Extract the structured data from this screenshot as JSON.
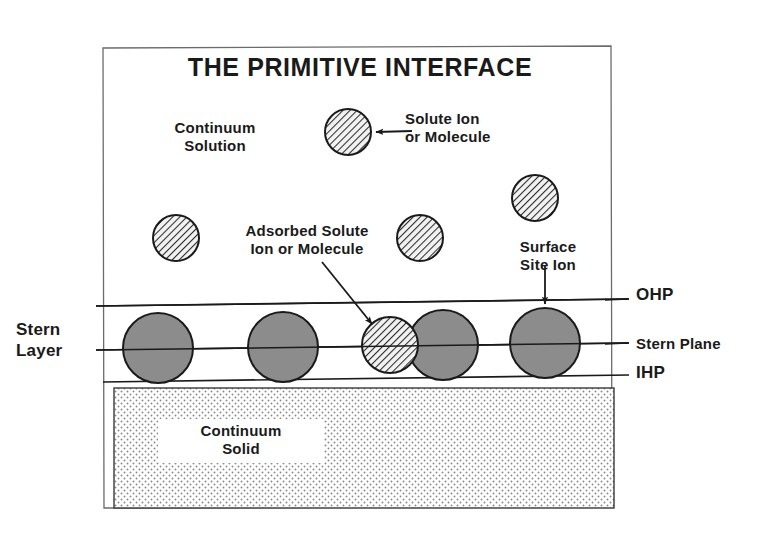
{
  "figure": {
    "title": "THE PRIMITIVE INTERFACE",
    "type": "schematic-diagram",
    "canvas": {
      "width": 762,
      "height": 547,
      "background": "#ffffff"
    },
    "frame": {
      "x": 103,
      "y": 47,
      "width": 509,
      "height": 461,
      "stroke": "#555555"
    }
  },
  "labels": {
    "title": "THE PRIMITIVE INTERFACE",
    "continuum_solution": "Continuum\nSolution",
    "solute_ion": "Solute Ion\nor Molecule",
    "adsorbed_solute": "Adsorbed Solute\nIon or Molecule",
    "surface_site_ion": "Surface\nSite Ion",
    "stern_layer": "Stern\nLayer",
    "ohp": "OHP",
    "stern_plane": "Stern Plane",
    "ihp": "IHP",
    "continuum_solid": "Continuum\nSolid"
  },
  "planes": [
    {
      "name": "OHP",
      "label": "OHP",
      "y_left": 305,
      "y_right": 299,
      "x_start": 96,
      "x_end": 629,
      "stroke": "#1a1a1a",
      "width": 1.6
    },
    {
      "name": "Stern Plane",
      "label": "Stern Plane",
      "y_left": 349,
      "y_right": 342,
      "x_start": 96,
      "x_end": 629,
      "stroke": "#1a1a1a",
      "width": 1.6
    },
    {
      "name": "IHP",
      "label": "IHP",
      "y_left": 381,
      "y_right": 374,
      "x_start": 103,
      "x_end": 629,
      "stroke": "#1a1a1a",
      "width": 1.6
    }
  ],
  "solid_block": {
    "name": "Continuum Solid",
    "x": 114,
    "y": 388,
    "width": 500,
    "height": 120,
    "fill_pattern": "stipple-dots",
    "stroke": "#333333"
  },
  "particles": {
    "solute_ions": [
      {
        "id": "solute-1",
        "cx": 348,
        "cy": 132,
        "r": 23,
        "style": "hatched",
        "region": "continuum-solution"
      },
      {
        "id": "solute-2",
        "cx": 176,
        "cy": 238,
        "r": 23,
        "style": "hatched",
        "region": "continuum-solution"
      },
      {
        "id": "solute-3",
        "cx": 420,
        "cy": 238,
        "r": 23,
        "style": "hatched",
        "region": "continuum-solution"
      },
      {
        "id": "solute-4",
        "cx": 535,
        "cy": 198,
        "r": 23,
        "style": "hatched",
        "region": "continuum-solution"
      }
    ],
    "adsorbed_ions": [
      {
        "id": "adsorbed-1",
        "cx": 390,
        "cy": 345,
        "r": 28,
        "style": "hatched",
        "region": "stern-layer"
      }
    ],
    "surface_site_ions": [
      {
        "id": "site-1",
        "cx": 158,
        "cy": 348,
        "r": 35,
        "style": "gray",
        "region": "stern-layer"
      },
      {
        "id": "site-2",
        "cx": 283,
        "cy": 347,
        "r": 35,
        "style": "gray",
        "region": "stern-layer"
      },
      {
        "id": "site-3",
        "cx": 443,
        "cy": 345,
        "r": 35,
        "style": "gray",
        "region": "stern-layer"
      },
      {
        "id": "site-4",
        "cx": 545,
        "cy": 343,
        "r": 35,
        "style": "gray",
        "region": "stern-layer"
      }
    ]
  },
  "arrows": [
    {
      "id": "arrow-solute-ion",
      "from": [
        412,
        132
      ],
      "to": [
        372,
        133
      ],
      "points_to": "solute-1"
    },
    {
      "id": "arrow-adsorbed",
      "from": [
        322,
        262
      ],
      "to": [
        374,
        326
      ],
      "points_to": "adsorbed-1"
    },
    {
      "id": "arrow-surface-site",
      "from": [
        545,
        268
      ],
      "to": [
        545,
        306
      ],
      "points_to": "site-4"
    }
  ],
  "colors": {
    "ink": "#1a1a1a",
    "frame": "#555555",
    "particle_gray_fill": "#8c8c8c",
    "particle_stroke": "#1a1a1a",
    "hatch_stroke": "#2b2b2b",
    "solid_stipple": "#8a8a8a",
    "background": "#ffffff"
  }
}
